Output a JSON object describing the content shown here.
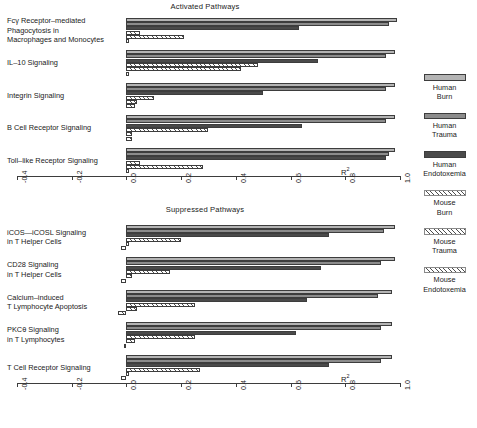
{
  "figure": {
    "r2_label": "R",
    "r2_sup": "2"
  },
  "legend": {
    "items": [
      {
        "name": "human-burn",
        "line1": "Human",
        "line2": "Burn",
        "pattern": "solid",
        "color": "#b4b4b4"
      },
      {
        "name": "human-trauma",
        "line1": "Human",
        "line2": "Trauma",
        "pattern": "solid",
        "color": "#8c8c8c"
      },
      {
        "name": "human-endotoxemia",
        "line1": "Human",
        "line2": "Endotoxemia",
        "pattern": "solid",
        "color": "#4a4a4a"
      },
      {
        "name": "mouse-burn",
        "line1": "Mouse",
        "line2": "Burn",
        "pattern": "hatch",
        "color": "#ffffff"
      },
      {
        "name": "mouse-trauma",
        "line1": "Mouse",
        "line2": "Trauma",
        "pattern": "hatch",
        "color": "#ffffff"
      },
      {
        "name": "mouse-endotoxemia",
        "line1": "Mouse",
        "line2": "Endotoxemia",
        "pattern": "hatch",
        "color": "#ffffff"
      }
    ]
  },
  "chart_data": [
    {
      "type": "bar",
      "orientation": "horizontal",
      "title": "Activated Pathways",
      "xlabel": "R2",
      "ylabel": "",
      "xlim": [
        -0.4,
        1.0
      ],
      "xticks": [
        -0.4,
        -0.2,
        0.0,
        0.2,
        0.4,
        0.6,
        0.8,
        1.0
      ],
      "xticklabels": [
        "-0.4",
        "-0.2",
        "0.0",
        "0.2",
        "0.4",
        "0.6",
        "0.8",
        "1.0"
      ],
      "grid": false,
      "legend_position": "right",
      "categories": [
        "Fcγ Receptor–mediated Phagocytosis in Macrophages and Monocytes",
        "IL–10 Signaling",
        "Integrin Signaling",
        "B Cell Receptor Signaling",
        "Toll–like Receptor Signaling"
      ],
      "category_lines": [
        [
          "Fcγ Receptor–mediated",
          "Phagocytosis in",
          "Macrophages and Monocytes"
        ],
        [
          "IL–10 Signaling"
        ],
        [
          "Integrin Signaling"
        ],
        [
          "B Cell Receptor Signaling"
        ],
        [
          "Toll–like Receptor Signaling"
        ]
      ],
      "series": [
        {
          "name": "Human Burn",
          "values": [
            0.99,
            0.98,
            0.98,
            0.98,
            0.98
          ]
        },
        {
          "name": "Human Trauma",
          "values": [
            0.96,
            0.95,
            0.95,
            0.95,
            0.96
          ]
        },
        {
          "name": "Human Endotoxemia",
          "values": [
            0.63,
            0.7,
            0.5,
            0.64,
            0.95
          ]
        },
        {
          "name": "Mouse Burn",
          "values": [
            0.05,
            0.48,
            0.1,
            0.3,
            0.05
          ]
        },
        {
          "name": "Mouse Trauma",
          "values": [
            0.21,
            0.42,
            0.04,
            0.02,
            0.28
          ]
        },
        {
          "name": "Mouse Endotoxemia",
          "values": [
            0.0,
            0.0,
            0.03,
            0.02,
            0.0
          ]
        }
      ]
    },
    {
      "type": "bar",
      "orientation": "horizontal",
      "title": "Suppressed Pathways",
      "xlabel": "R2",
      "ylabel": "",
      "xlim": [
        -0.4,
        1.0
      ],
      "xticks": [
        -0.4,
        -0.2,
        0.0,
        0.2,
        0.4,
        0.6,
        0.8,
        1.0
      ],
      "xticklabels": [
        "-0.4",
        "-0.2",
        "0.0",
        "0.2",
        "0.4",
        "0.6",
        "0.8",
        "1.0"
      ],
      "grid": false,
      "legend_position": "right",
      "categories": [
        "iCOS—iCOSL Signaling in T Helper Cells",
        "CD28 Signaling in T Helper Cells",
        "Calcium–induced T Lymphocyte Apoptosis",
        "PKCθ Signaling in T Lymphocytes",
        "T Cell Receptor Signaling"
      ],
      "category_lines": [
        [
          "iCOS—iCOSL Signaling",
          "in T Helper Cells"
        ],
        [
          "CD28 Signaling",
          "in T Helper Cells"
        ],
        [
          "Calcium–induced",
          "T Lymphocyte Apoptosis"
        ],
        [
          "PKCθ Signaling",
          "in T Lymphocytes"
        ],
        [
          "T Cell Receptor Signaling"
        ]
      ],
      "series": [
        {
          "name": "Human Burn",
          "values": [
            0.98,
            0.98,
            0.97,
            0.97,
            0.97
          ]
        },
        {
          "name": "Human Trauma",
          "values": [
            0.94,
            0.93,
            0.92,
            0.93,
            0.93
          ]
        },
        {
          "name": "Human Endotoxemia",
          "values": [
            0.74,
            0.71,
            0.66,
            0.62,
            0.74
          ]
        },
        {
          "name": "Mouse Burn",
          "values": [
            0.2,
            0.16,
            0.25,
            0.25,
            0.27
          ]
        },
        {
          "name": "Mouse Trauma",
          "values": [
            0.0,
            0.02,
            0.04,
            0.03,
            0.0
          ]
        },
        {
          "name": "Mouse Endotoxemia",
          "values": [
            -0.02,
            -0.02,
            -0.03,
            -0.01,
            -0.02
          ]
        }
      ]
    }
  ]
}
